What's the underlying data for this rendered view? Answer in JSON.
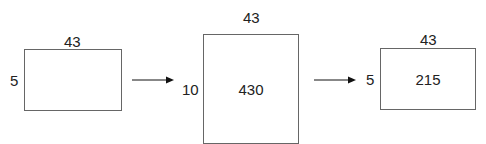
{
  "diagram": {
    "stages": [
      {
        "width_label": "43",
        "height_label": "5",
        "area_label": ""
      },
      {
        "width_label": "43",
        "height_label": "10",
        "area_label": "430"
      },
      {
        "width_label": "43",
        "height_label": "5",
        "area_label": "215"
      }
    ],
    "arrows": [
      {
        "from": 0,
        "to": 1
      },
      {
        "from": 1,
        "to": 2
      }
    ],
    "colors": {
      "stroke": "#666666",
      "text": "#222222",
      "arrow": "#111111"
    }
  }
}
